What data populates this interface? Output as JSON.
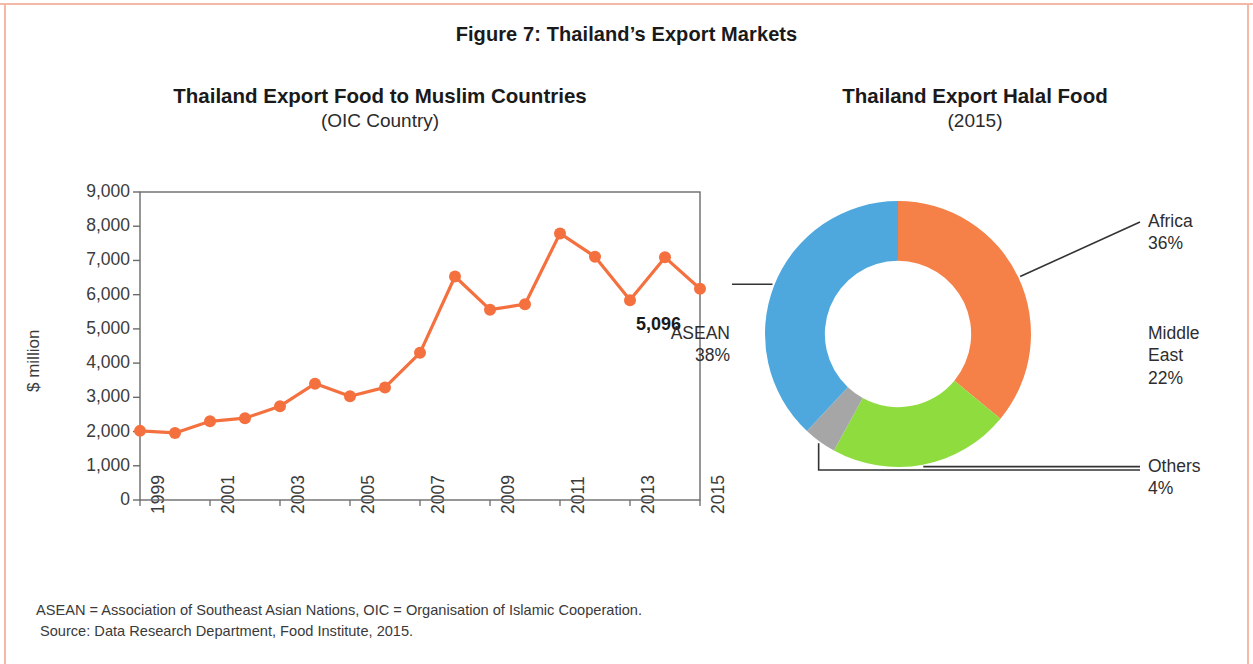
{
  "figure": {
    "title": "Figure 7: Thailand’s Export Markets"
  },
  "left_panel": {
    "title": "Thailand Export Food to Muslim Countries",
    "subtitle": "(OIC Country)"
  },
  "right_panel": {
    "title": "Thailand Export Halal Food",
    "subtitle": "(2015)"
  },
  "notes": {
    "line1": "ASEAN = Association of Southeast Asian Nations, OIC = Organisation of Islamic Cooperation.",
    "line2": "Source: Data Research Department, Food Institute, 2015."
  },
  "colors": {
    "line": "#F4713F",
    "marker": "#F4713F",
    "africa": "#F58149",
    "middle_east": "#8FDC3F",
    "others": "#A6A6A6",
    "asean": "#4FA8DD",
    "axis": "#6b6b6b",
    "text": "#2e2e2e"
  },
  "chart_data": [
    {
      "type": "line",
      "title": "Thailand Export Food to Muslim Countries",
      "subtitle": "(OIC Country)",
      "xlabel": "",
      "ylabel": "$ million",
      "ylim": [
        0,
        9000
      ],
      "ytick_labels": [
        "9,000",
        "8,000",
        "7,000",
        "6,000",
        "5,000",
        "4,000",
        "3,000",
        "2,000",
        "1,000",
        "0"
      ],
      "ytick_values": [
        9000,
        8000,
        7000,
        6000,
        5000,
        4000,
        3000,
        2000,
        1000,
        0
      ],
      "xtick_labels": [
        "1999",
        "2001",
        "2003",
        "2005",
        "2007",
        "2009",
        "2011",
        "2013",
        "2015"
      ],
      "x": [
        1999,
        2000,
        2001,
        2002,
        2003,
        2004,
        2005,
        2006,
        2007,
        2008,
        2009,
        2010,
        2011,
        2012,
        2013,
        2014,
        2015
      ],
      "values": [
        2020,
        1960,
        2300,
        2390,
        2740,
        3400,
        3030,
        3290,
        4300,
        6530,
        5560,
        5720,
        7790,
        7110,
        5840,
        7090,
        6170
      ],
      "grid": false,
      "legend": "none",
      "annotations": [
        {
          "text": "5,096",
          "x": 2015,
          "y": 5096
        }
      ]
    },
    {
      "type": "pie",
      "variant": "donut",
      "title": "Thailand Export Halal Food",
      "subtitle": "(2015)",
      "labels": [
        "Africa",
        "Middle East",
        "Others",
        "ASEAN"
      ],
      "values": [
        36,
        22,
        4,
        38
      ],
      "value_labels": [
        "36%",
        "22%",
        "4%",
        "38%"
      ],
      "colors": [
        "#F58149",
        "#8FDC3F",
        "#A6A6A6",
        "#4FA8DD"
      ],
      "start_angle_deg": 0,
      "direction": "clockwise",
      "hole_ratio": 0.55,
      "legend": "callout-labels"
    }
  ],
  "donut_callouts": [
    {
      "name": "Africa",
      "label": "Africa",
      "pct": "36%"
    },
    {
      "name": "Middle East",
      "label_l1": "Middle",
      "label_l2": "East",
      "pct": "22%"
    },
    {
      "name": "Others",
      "label": "Others",
      "pct": "4%"
    },
    {
      "name": "ASEAN",
      "label": "ASEAN",
      "pct": "38%"
    }
  ]
}
